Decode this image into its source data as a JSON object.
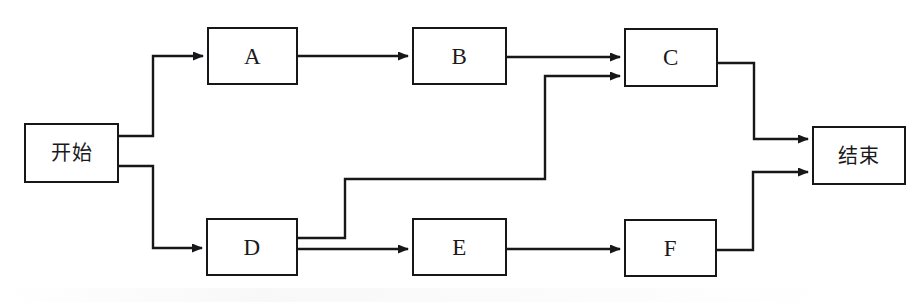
{
  "diagram": {
    "type": "flowchart",
    "background_color": "#ffffff",
    "stroke_color": "#17171a",
    "nodes": [
      {
        "id": "start",
        "label": "开始",
        "script": "cjk",
        "x": 24,
        "y": 123,
        "w": 95,
        "h": 60
      },
      {
        "id": "a",
        "label": "A",
        "script": "latin",
        "x": 207,
        "y": 27,
        "w": 91,
        "h": 58
      },
      {
        "id": "b",
        "label": "B",
        "script": "latin",
        "x": 412,
        "y": 27,
        "w": 95,
        "h": 58
      },
      {
        "id": "c",
        "label": "C",
        "script": "latin",
        "x": 624,
        "y": 28,
        "w": 94,
        "h": 59
      },
      {
        "id": "d",
        "label": "D",
        "script": "latin",
        "x": 206,
        "y": 218,
        "w": 92,
        "h": 58
      },
      {
        "id": "e",
        "label": "E",
        "script": "latin",
        "x": 412,
        "y": 218,
        "w": 95,
        "h": 58
      },
      {
        "id": "f",
        "label": "F",
        "script": "latin",
        "x": 624,
        "y": 219,
        "w": 93,
        "h": 58
      },
      {
        "id": "end",
        "label": "结束",
        "script": "cjk",
        "x": 812,
        "y": 126,
        "w": 94,
        "h": 59
      }
    ],
    "edges": [
      {
        "id": "start-to-a",
        "from": "start",
        "to": "a",
        "points": "119,136 153,136 153,56 203,56",
        "arrow": true
      },
      {
        "id": "a-to-b",
        "from": "a",
        "to": "b",
        "points": "298,56 408,56",
        "arrow": true
      },
      {
        "id": "b-to-c",
        "from": "b",
        "to": "c",
        "points": "507,57 620,57",
        "arrow": true
      },
      {
        "id": "c-to-end",
        "from": "c",
        "to": "end",
        "points": "718,63 754,63 754,139 808,139",
        "arrow": true
      },
      {
        "id": "start-to-d",
        "from": "start",
        "to": "d",
        "points": "119,166 153,166 153,248 202,248",
        "arrow": true
      },
      {
        "id": "d-to-c",
        "from": "d",
        "to": "c",
        "points": "298,238 345,238 345,179 545,179 545,76 620,76",
        "arrow": true
      },
      {
        "id": "d-to-e",
        "from": "d",
        "to": "e",
        "points": "298,249 408,249",
        "arrow": true
      },
      {
        "id": "e-to-f",
        "from": "e",
        "to": "f",
        "points": "507,249 620,249",
        "arrow": true
      },
      {
        "id": "f-to-end",
        "from": "f",
        "to": "end",
        "points": "717,250 753,250 753,172 808,172",
        "arrow": true
      }
    ]
  }
}
